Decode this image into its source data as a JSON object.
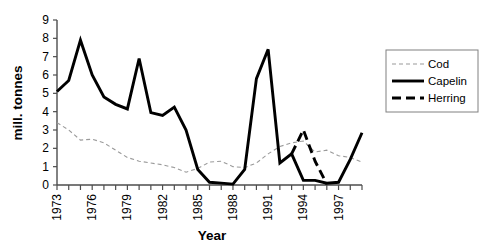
{
  "chart_data": {
    "type": "line",
    "title": "",
    "xlabel": "Year",
    "ylabel": "mill. tonnes",
    "xlim": [
      1973,
      1999
    ],
    "ylim": [
      0,
      9
    ],
    "grid": false,
    "legend_position": "right",
    "x_tick_labels": [
      "1973",
      "1976",
      "1979",
      "1982",
      "1985",
      "1988",
      "1991",
      "1994",
      "1997"
    ],
    "x_tick_values": [
      1973,
      1976,
      1979,
      1982,
      1985,
      1988,
      1991,
      1994,
      1997
    ],
    "y_tick_labels": [
      "0",
      "1",
      "2",
      "3",
      "4",
      "5",
      "6",
      "7",
      "8",
      "9"
    ],
    "y_tick_values": [
      0,
      1,
      2,
      3,
      4,
      5,
      6,
      7,
      8,
      9
    ],
    "x": [
      1973,
      1974,
      1975,
      1976,
      1977,
      1978,
      1979,
      1980,
      1981,
      1982,
      1983,
      1984,
      1985,
      1986,
      1987,
      1988,
      1989,
      1990,
      1991,
      1992,
      1993,
      1994,
      1995,
      1996,
      1997,
      1998,
      1999
    ],
    "series": [
      {
        "name": "Cod",
        "color": "#9a9a9a",
        "style": "thin-dashed",
        "x": [
          1973,
          1974,
          1975,
          1976,
          1977,
          1978,
          1979,
          1980,
          1981,
          1982,
          1983,
          1984,
          1985,
          1986,
          1987,
          1988,
          1989,
          1990,
          1991,
          1992,
          1993,
          1994,
          1995,
          1996,
          1997,
          1998,
          1999
        ],
        "values": [
          3.4,
          3.0,
          2.45,
          2.5,
          2.3,
          1.9,
          1.5,
          1.3,
          1.2,
          1.1,
          0.95,
          0.7,
          0.9,
          1.25,
          1.3,
          1.0,
          0.95,
          1.2,
          1.7,
          2.1,
          2.3,
          2.4,
          1.8,
          1.9,
          1.6,
          1.5,
          1.25
        ]
      },
      {
        "name": "Capelin",
        "color": "#000000",
        "style": "thick-solid",
        "x": [
          1973,
          1974,
          1975,
          1976,
          1977,
          1978,
          1979,
          1980,
          1981,
          1982,
          1983,
          1984,
          1985,
          1986,
          1987,
          1988,
          1989,
          1990,
          1991,
          1992,
          1993,
          1994,
          1995,
          1996,
          1997,
          1998,
          1999
        ],
        "values": [
          5.1,
          5.7,
          7.9,
          6.0,
          4.8,
          4.4,
          4.15,
          6.9,
          3.95,
          3.8,
          4.25,
          3.0,
          0.85,
          0.15,
          0.1,
          0.05,
          0.85,
          5.8,
          7.4,
          1.2,
          1.7,
          0.25,
          0.25,
          0.1,
          0.15,
          1.4,
          2.85
        ]
      },
      {
        "name": "Herring",
        "color": "#000000",
        "style": "thick-dashed",
        "x": [
          1993,
          1994,
          1995,
          1996
        ],
        "values": [
          1.7,
          3.0,
          1.3,
          0.05
        ]
      }
    ],
    "legend": [
      {
        "label": "Cod",
        "style": "thin-dashed",
        "color": "#9a9a9a"
      },
      {
        "label": "Capelin",
        "style": "thick-solid",
        "color": "#000000"
      },
      {
        "label": "Herring",
        "style": "thick-dashed",
        "color": "#000000"
      }
    ]
  }
}
